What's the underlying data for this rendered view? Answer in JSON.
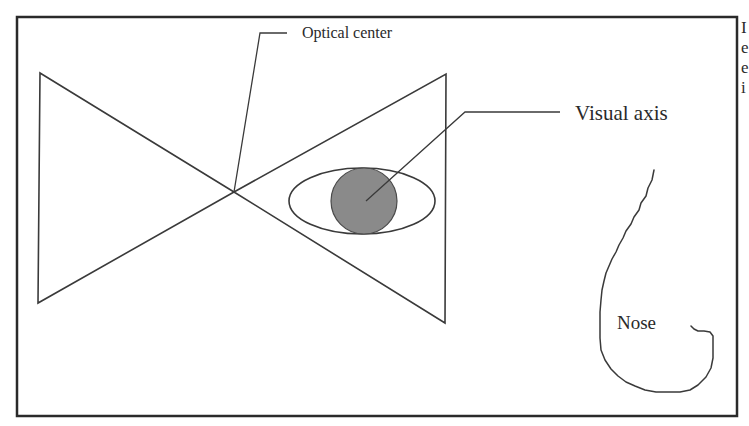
{
  "figure": {
    "labels": {
      "optical_center": "Optical center",
      "visual_axis": "Visual axis",
      "nose": "Nose"
    },
    "edge_text_fragment": "I\ne\ne\ni",
    "colors": {
      "line": "#3a3a3a",
      "frame": "#2a2a2a",
      "pupil_fill": "#8a8a8a",
      "background": "#ffffff"
    },
    "elements": {
      "frame": {
        "x": 17,
        "y": 17,
        "width": 720,
        "height": 399
      },
      "left_triangle": {
        "points": "40,73 38,303 234,192"
      },
      "right_triangle": {
        "points": "446,74 445,323 234,192"
      },
      "optical_center_point": {
        "x": 234,
        "y": 192
      },
      "eye_ellipse": {
        "cx": 362,
        "cy": 201,
        "rx": 73,
        "ry": 33
      },
      "pupil": {
        "cx": 364,
        "cy": 201,
        "r": 33
      },
      "optical_center_leader": "234,192 260,33 287,33",
      "visual_axis_leader": "366,201 465,112 560,112"
    }
  }
}
